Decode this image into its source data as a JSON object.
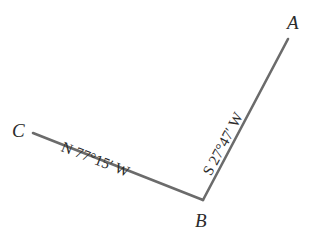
{
  "figure": {
    "kind": "surveying-traverse-diagram",
    "width": 321,
    "height": 243,
    "background_color": "#ffffff",
    "line_color": "#6b6b6b",
    "text_color": "#2b2b2b",
    "line_width": 2.6
  },
  "vertices": [
    {
      "id": "c",
      "label": "C",
      "x": 33,
      "y": 133
    },
    {
      "id": "b",
      "label": "B",
      "x": 203,
      "y": 200
    },
    {
      "id": "a",
      "label": "A",
      "x": 288,
      "y": 39
    }
  ],
  "segments": [
    {
      "id": "cb",
      "from": "C",
      "to": "B",
      "bearing": "N 77°15′ W",
      "rotation_deg": 21.5
    },
    {
      "id": "ba",
      "from": "B",
      "to": "A",
      "bearing": "S 27°47′ W",
      "rotation_deg": -62
    }
  ]
}
